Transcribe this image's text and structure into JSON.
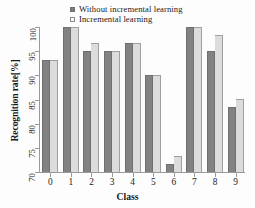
{
  "chart_data": {
    "type": "bar",
    "title": "",
    "xlabel": "Class",
    "ylabel": "Recognition rate[%]",
    "categories": [
      "0",
      "1",
      "2",
      "3",
      "4",
      "5",
      "6",
      "7",
      "8",
      "9"
    ],
    "ylim": [
      70,
      100
    ],
    "yticks": [
      70,
      75,
      80,
      85,
      90,
      95,
      100
    ],
    "grid": false,
    "legend_position": "top-center",
    "series": [
      {
        "name": "Without incremental learning",
        "color": "#828282",
        "marker": "filled-square",
        "values": [
          93.2,
          100.0,
          95.0,
          95.0,
          96.7,
          90.0,
          71.6,
          100.0,
          95.1,
          83.4
        ]
      },
      {
        "name": "Incremental learning",
        "color": "#dcdcdc",
        "marker": "open-square",
        "values": [
          93.2,
          100.0,
          96.7,
          95.0,
          96.7,
          90.0,
          73.4,
          100.0,
          98.4,
          85.1
        ]
      }
    ]
  }
}
